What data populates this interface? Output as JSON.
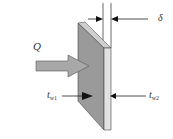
{
  "diagram": {
    "labels": {
      "heat_flow": "Q",
      "thickness": "δ",
      "tw1_main": "t",
      "tw1_sub": "w1",
      "tw2_main": "t",
      "tw2_sub": "w2"
    },
    "colors": {
      "wall_front": "#9a9a9a",
      "wall_side": "#e2e2e2",
      "wall_top": "#cfcfcf",
      "arrow_fill": "#a8a8a8",
      "line": "#222222",
      "text": "#333333"
    }
  }
}
